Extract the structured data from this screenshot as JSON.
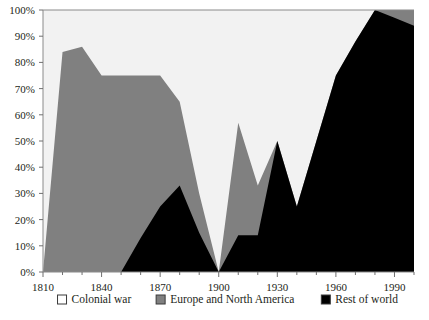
{
  "chart_data": {
    "type": "area",
    "title": "",
    "subtitle": "",
    "xlabel": "",
    "ylabel": "",
    "stacked": true,
    "normalized": true,
    "grid": false,
    "legend_position": "bottom",
    "xlim": [
      1810,
      2000
    ],
    "ylim": [
      0,
      100
    ],
    "ytick_labels": [
      "0%",
      "10%",
      "20%",
      "30%",
      "40%",
      "50%",
      "60%",
      "70%",
      "80%",
      "90%",
      "100%"
    ],
    "ytick_values": [
      0,
      10,
      20,
      30,
      40,
      50,
      60,
      70,
      80,
      90,
      100
    ],
    "xtick_labels": [
      "1810",
      "1840",
      "1870",
      "1900",
      "1930",
      "1960",
      "1990"
    ],
    "xtick_values": [
      1810,
      1840,
      1870,
      1900,
      1930,
      1960,
      1990
    ],
    "x_minor_step": 10,
    "x": [
      1810,
      1820,
      1830,
      1840,
      1850,
      1860,
      1870,
      1880,
      1890,
      1900,
      1910,
      1920,
      1930,
      1940,
      1950,
      1960,
      1970,
      1980,
      1990,
      2000
    ],
    "series": [
      {
        "name": "Rest of world",
        "color": "#000000",
        "order": 1,
        "values": [
          0,
          0,
          0,
          0,
          0,
          13,
          25,
          33,
          15,
          0,
          14,
          14,
          50,
          25,
          50,
          75,
          88,
          100,
          97,
          94
        ]
      },
      {
        "name": "Europe and North America",
        "color": "#808080",
        "order": 2,
        "values": [
          0,
          84,
          86,
          75,
          75,
          62,
          50,
          32,
          15,
          0,
          43,
          19,
          0,
          0,
          0,
          0,
          0,
          0,
          3,
          6
        ]
      },
      {
        "name": "Colonial war",
        "color": "#f2f2f2",
        "order": 3,
        "values": [
          100,
          16,
          14,
          25,
          25,
          25,
          25,
          35,
          70,
          100,
          43,
          67,
          50,
          75,
          50,
          25,
          12,
          0,
          0,
          0
        ]
      }
    ],
    "cumulative_upper_bounds": {
      "rest_of_world": [
        0,
        0,
        0,
        0,
        0,
        13,
        25,
        33,
        15,
        0,
        14,
        14,
        50,
        25,
        50,
        75,
        88,
        100,
        97,
        94
      ],
      "plus_europe_north_america": [
        0,
        84,
        86,
        75,
        75,
        75,
        75,
        65,
        30,
        0,
        57,
        33,
        50,
        25,
        50,
        75,
        88,
        100,
        100,
        100
      ]
    }
  },
  "legend": {
    "items": [
      {
        "label": "Colonial war",
        "color": "#ffffff"
      },
      {
        "label": "Europe and North America",
        "color": "#808080"
      },
      {
        "label": "Rest of world",
        "color": "#000000"
      }
    ]
  }
}
